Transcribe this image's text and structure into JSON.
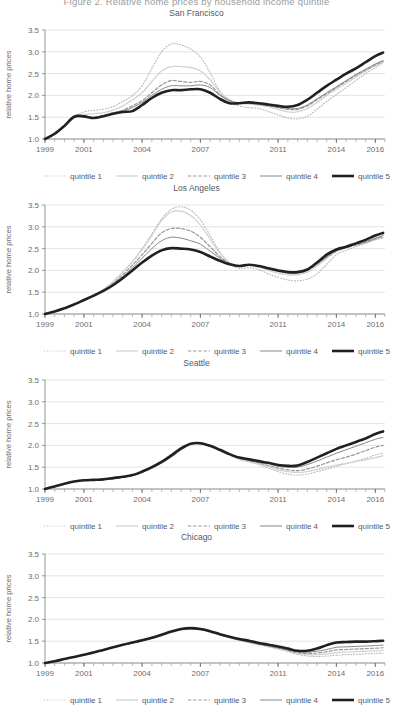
{
  "figure": {
    "suptitle": "Figure 2. Relative home prices by household income quintile",
    "ylabel": "relative home prices",
    "y_ticks": [
      "1.0",
      "1.5",
      "2.0",
      "2.5",
      "3.0",
      "3.5"
    ],
    "x_ticks": [
      "1999",
      "2001",
      "2004",
      "2007",
      "2011",
      "2014",
      "2016"
    ]
  },
  "legend": {
    "items": [
      {
        "label": "quintile 1",
        "style": "dotted",
        "color": "#b4b4b6",
        "width": 1.1
      },
      {
        "label": "quintile 2",
        "style": "solid",
        "color": "#d2d2d4",
        "width": 1.3
      },
      {
        "label": "quintile 3",
        "style": "dashed",
        "color": "#969698",
        "width": 1.2
      },
      {
        "label": "quintile 4",
        "style": "solid",
        "color": "#88888b",
        "width": 1.0
      },
      {
        "label": "quintile 5",
        "style": "solid",
        "color": "#231f20",
        "width": 2.6
      }
    ]
  },
  "chart_data": {
    "type": "line",
    "title": "Figure 2. Relative home prices by household income quintile",
    "xlabel": "",
    "ylabel": "relative home prices",
    "xlim": [
      1999,
      2016.5
    ],
    "ylim": [
      1.0,
      3.5
    ],
    "y_ticks": [
      1.0,
      1.5,
      2.0,
      2.5,
      3.0,
      3.5
    ],
    "x_ticks": [
      1999,
      2001,
      2004,
      2007,
      2011,
      2014,
      2016
    ],
    "grid": "horizontal",
    "legend_position": "below",
    "x": [
      1999,
      1999.5,
      2000,
      2000.5,
      2001,
      2001.5,
      2002,
      2002.5,
      2003,
      2003.5,
      2004,
      2004.5,
      2005,
      2005.5,
      2006,
      2006.5,
      2007,
      2007.5,
      2008,
      2008.5,
      2009,
      2009.5,
      2010,
      2010.5,
      2011,
      2011.5,
      2012,
      2012.5,
      2013,
      2013.5,
      2014,
      2014.5,
      2015,
      2015.5,
      2016,
      2016.4
    ],
    "panels": [
      {
        "name": "San Francisco",
        "series": [
          {
            "name": "quintile 1",
            "values": [
              1.0,
              1.12,
              1.32,
              1.52,
              1.62,
              1.66,
              1.68,
              1.74,
              1.86,
              2.0,
              2.22,
              2.62,
              3.0,
              3.18,
              3.16,
              3.06,
              2.88,
              2.52,
              2.1,
              1.86,
              1.76,
              1.72,
              1.7,
              1.63,
              1.55,
              1.48,
              1.46,
              1.52,
              1.68,
              1.86,
              2.02,
              2.18,
              2.34,
              2.5,
              2.64,
              2.74
            ]
          },
          {
            "name": "quintile 2",
            "values": [
              1.0,
              1.12,
              1.3,
              1.5,
              1.56,
              1.58,
              1.6,
              1.66,
              1.76,
              1.9,
              2.06,
              2.32,
              2.56,
              2.66,
              2.66,
              2.64,
              2.56,
              2.36,
              2.08,
              1.9,
              1.82,
              1.8,
              1.78,
              1.74,
              1.68,
              1.62,
              1.62,
              1.7,
              1.84,
              2.0,
              2.14,
              2.28,
              2.42,
              2.56,
              2.68,
              2.76
            ]
          },
          {
            "name": "quintile 3",
            "values": [
              1.0,
              1.12,
              1.3,
              1.5,
              1.52,
              1.5,
              1.54,
              1.6,
              1.66,
              1.76,
              1.88,
              2.06,
              2.24,
              2.34,
              2.32,
              2.3,
              2.32,
              2.24,
              2.02,
              1.88,
              1.82,
              1.82,
              1.8,
              1.76,
              1.72,
              1.68,
              1.68,
              1.76,
              1.9,
              2.04,
              2.18,
              2.32,
              2.46,
              2.58,
              2.7,
              2.78
            ]
          },
          {
            "name": "quintile 4",
            "values": [
              1.0,
              1.12,
              1.3,
              1.5,
              1.52,
              1.49,
              1.52,
              1.58,
              1.64,
              1.72,
              1.84,
              2.0,
              2.14,
              2.22,
              2.22,
              2.22,
              2.24,
              2.18,
              2.0,
              1.88,
              1.82,
              1.82,
              1.8,
              1.77,
              1.74,
              1.7,
              1.7,
              1.78,
              1.92,
              2.06,
              2.2,
              2.34,
              2.48,
              2.6,
              2.72,
              2.8
            ]
          },
          {
            "name": "quintile 5",
            "values": [
              1.0,
              1.12,
              1.3,
              1.51,
              1.52,
              1.48,
              1.52,
              1.58,
              1.62,
              1.64,
              1.78,
              1.94,
              2.06,
              2.12,
              2.12,
              2.14,
              2.14,
              2.06,
              1.92,
              1.82,
              1.82,
              1.84,
              1.82,
              1.79,
              1.76,
              1.74,
              1.78,
              1.9,
              2.06,
              2.22,
              2.36,
              2.5,
              2.62,
              2.76,
              2.9,
              2.98
            ]
          }
        ]
      },
      {
        "name": "Los Angeles",
        "series": [
          {
            "name": "quintile 1",
            "values": [
              1.0,
              1.06,
              1.13,
              1.22,
              1.32,
              1.42,
              1.56,
              1.74,
              1.96,
              2.2,
              2.5,
              2.84,
              3.18,
              3.4,
              3.46,
              3.38,
              3.16,
              2.8,
              2.42,
              2.16,
              2.04,
              2.06,
              2.02,
              1.92,
              1.84,
              1.78,
              1.76,
              1.8,
              1.92,
              2.14,
              2.36,
              2.46,
              2.54,
              2.62,
              2.7,
              2.74
            ]
          },
          {
            "name": "quintile 2",
            "values": [
              1.0,
              1.06,
              1.13,
              1.22,
              1.32,
              1.42,
              1.56,
              1.74,
              1.96,
              2.2,
              2.48,
              2.8,
              3.14,
              3.34,
              3.36,
              3.26,
              3.04,
              2.72,
              2.4,
              2.18,
              2.1,
              2.12,
              2.08,
              2.0,
              1.94,
              1.9,
              1.9,
              1.96,
              2.1,
              2.28,
              2.44,
              2.52,
              2.58,
              2.64,
              2.72,
              2.76
            ]
          },
          {
            "name": "quintile 3",
            "values": [
              1.0,
              1.06,
              1.13,
              1.22,
              1.32,
              1.42,
              1.54,
              1.7,
              1.9,
              2.12,
              2.36,
              2.62,
              2.86,
              2.96,
              2.96,
              2.9,
              2.76,
              2.54,
              2.32,
              2.16,
              2.1,
              2.13,
              2.1,
              2.03,
              1.98,
              1.94,
              1.94,
              2.0,
              2.14,
              2.3,
              2.44,
              2.52,
              2.58,
              2.64,
              2.72,
              2.78
            ]
          },
          {
            "name": "quintile 4",
            "values": [
              1.0,
              1.06,
              1.13,
              1.22,
              1.32,
              1.42,
              1.54,
              1.68,
              1.86,
              2.06,
              2.28,
              2.5,
              2.68,
              2.76,
              2.74,
              2.68,
              2.6,
              2.44,
              2.28,
              2.14,
              2.1,
              2.13,
              2.1,
              2.04,
              2.0,
              1.96,
              1.96,
              2.02,
              2.16,
              2.32,
              2.46,
              2.54,
              2.6,
              2.66,
              2.74,
              2.8
            ]
          },
          {
            "name": "quintile 5",
            "values": [
              1.0,
              1.06,
              1.13,
              1.22,
              1.32,
              1.42,
              1.53,
              1.66,
              1.82,
              2.0,
              2.18,
              2.34,
              2.46,
              2.51,
              2.5,
              2.48,
              2.42,
              2.32,
              2.22,
              2.14,
              2.1,
              2.13,
              2.1,
              2.05,
              2.0,
              1.96,
              1.96,
              2.02,
              2.18,
              2.36,
              2.48,
              2.54,
              2.62,
              2.7,
              2.8,
              2.86
            ]
          }
        ]
      },
      {
        "name": "Seattle",
        "series": [
          {
            "name": "quintile 1",
            "values": [
              1.0,
              1.06,
              1.12,
              1.17,
              1.2,
              1.21,
              1.22,
              1.24,
              1.27,
              1.31,
              1.38,
              1.48,
              1.6,
              1.74,
              1.9,
              2.02,
              2.04,
              1.98,
              1.88,
              1.78,
              1.68,
              1.62,
              1.56,
              1.48,
              1.4,
              1.34,
              1.32,
              1.34,
              1.4,
              1.46,
              1.52,
              1.58,
              1.64,
              1.7,
              1.78,
              1.82
            ]
          },
          {
            "name": "quintile 2",
            "values": [
              1.0,
              1.06,
              1.12,
              1.17,
              1.2,
              1.21,
              1.22,
              1.24,
              1.27,
              1.31,
              1.38,
              1.48,
              1.6,
              1.74,
              1.9,
              2.03,
              2.04,
              1.98,
              1.88,
              1.78,
              1.68,
              1.63,
              1.58,
              1.52,
              1.44,
              1.4,
              1.38,
              1.4,
              1.45,
              1.5,
              1.55,
              1.59,
              1.63,
              1.67,
              1.72,
              1.76
            ]
          },
          {
            "name": "quintile 3",
            "values": [
              1.0,
              1.06,
              1.12,
              1.17,
              1.2,
              1.21,
              1.22,
              1.24,
              1.27,
              1.31,
              1.38,
              1.48,
              1.6,
              1.74,
              1.9,
              2.03,
              2.04,
              1.98,
              1.88,
              1.78,
              1.7,
              1.65,
              1.6,
              1.54,
              1.48,
              1.44,
              1.42,
              1.46,
              1.52,
              1.6,
              1.67,
              1.73,
              1.8,
              1.88,
              1.96,
              2.0
            ]
          },
          {
            "name": "quintile 4",
            "values": [
              1.0,
              1.06,
              1.12,
              1.17,
              1.2,
              1.21,
              1.22,
              1.24,
              1.27,
              1.31,
              1.38,
              1.48,
              1.6,
              1.74,
              1.9,
              2.03,
              2.04,
              1.98,
              1.88,
              1.79,
              1.71,
              1.66,
              1.62,
              1.58,
              1.52,
              1.5,
              1.5,
              1.56,
              1.64,
              1.73,
              1.82,
              1.9,
              1.98,
              2.06,
              2.14,
              2.18
            ]
          },
          {
            "name": "quintile 5",
            "values": [
              1.0,
              1.06,
              1.12,
              1.17,
              1.2,
              1.21,
              1.22,
              1.25,
              1.28,
              1.32,
              1.4,
              1.5,
              1.62,
              1.77,
              1.93,
              2.04,
              2.05,
              1.99,
              1.9,
              1.8,
              1.72,
              1.68,
              1.64,
              1.6,
              1.55,
              1.53,
              1.54,
              1.62,
              1.72,
              1.82,
              1.92,
              2.0,
              2.08,
              2.16,
              2.26,
              2.32
            ]
          }
        ]
      },
      {
        "name": "Chicago",
        "series": [
          {
            "name": "quintile 1",
            "values": [
              1.0,
              1.04,
              1.09,
              1.14,
              1.19,
              1.24,
              1.3,
              1.36,
              1.41,
              1.46,
              1.5,
              1.56,
              1.63,
              1.7,
              1.76,
              1.78,
              1.76,
              1.71,
              1.64,
              1.58,
              1.52,
              1.47,
              1.42,
              1.37,
              1.32,
              1.26,
              1.2,
              1.16,
              1.15,
              1.16,
              1.18,
              1.19,
              1.2,
              1.21,
              1.22,
              1.23
            ]
          },
          {
            "name": "quintile 2",
            "values": [
              1.0,
              1.04,
              1.09,
              1.14,
              1.19,
              1.24,
              1.3,
              1.36,
              1.41,
              1.46,
              1.5,
              1.56,
              1.63,
              1.7,
              1.76,
              1.78,
              1.76,
              1.71,
              1.64,
              1.58,
              1.52,
              1.47,
              1.42,
              1.38,
              1.33,
              1.28,
              1.22,
              1.19,
              1.19,
              1.21,
              1.24,
              1.25,
              1.26,
              1.27,
              1.28,
              1.29
            ]
          },
          {
            "name": "quintile 3",
            "values": [
              1.0,
              1.04,
              1.09,
              1.14,
              1.19,
              1.24,
              1.3,
              1.36,
              1.41,
              1.46,
              1.51,
              1.57,
              1.64,
              1.71,
              1.77,
              1.79,
              1.77,
              1.72,
              1.65,
              1.59,
              1.53,
              1.48,
              1.43,
              1.39,
              1.34,
              1.29,
              1.24,
              1.22,
              1.23,
              1.26,
              1.3,
              1.31,
              1.32,
              1.33,
              1.34,
              1.35
            ]
          },
          {
            "name": "quintile 4",
            "values": [
              1.0,
              1.04,
              1.09,
              1.14,
              1.19,
              1.24,
              1.3,
              1.36,
              1.41,
              1.46,
              1.51,
              1.57,
              1.64,
              1.71,
              1.77,
              1.79,
              1.77,
              1.72,
              1.65,
              1.59,
              1.53,
              1.49,
              1.44,
              1.4,
              1.36,
              1.31,
              1.26,
              1.25,
              1.27,
              1.31,
              1.36,
              1.37,
              1.38,
              1.39,
              1.4,
              1.41
            ]
          },
          {
            "name": "quintile 5",
            "values": [
              1.0,
              1.04,
              1.09,
              1.14,
              1.19,
              1.24,
              1.3,
              1.36,
              1.42,
              1.47,
              1.52,
              1.58,
              1.65,
              1.72,
              1.78,
              1.8,
              1.78,
              1.73,
              1.66,
              1.6,
              1.55,
              1.51,
              1.46,
              1.42,
              1.38,
              1.33,
              1.28,
              1.28,
              1.33,
              1.41,
              1.47,
              1.48,
              1.49,
              1.49,
              1.5,
              1.51
            ]
          }
        ]
      }
    ]
  }
}
